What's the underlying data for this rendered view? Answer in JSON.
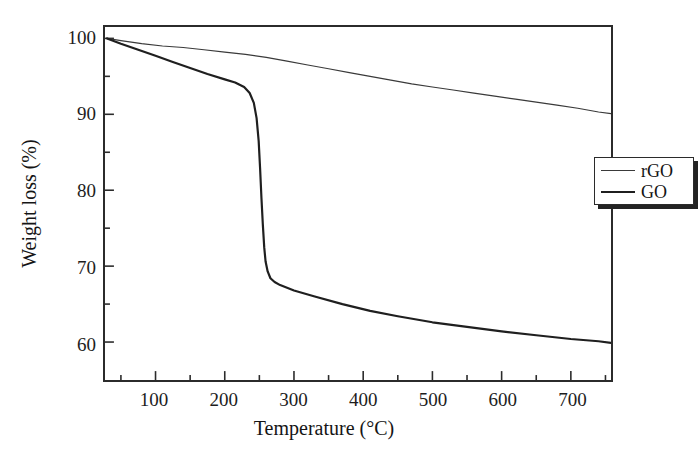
{
  "chart_data": {
    "type": "line",
    "title": "",
    "xlabel": "Temperature (°C)",
    "ylabel": "Weight loss (%)",
    "xlim": [
      27,
      758
    ],
    "ylim": [
      55,
      101.5
    ],
    "grid": false,
    "legend_position": "center-right",
    "x_major_ticks": [
      100,
      200,
      300,
      400,
      500,
      600,
      700
    ],
    "x_major_tick_labels": [
      "100",
      "200",
      "300",
      "400",
      "500",
      "600",
      "700"
    ],
    "x_minor_tick_step": 50,
    "y_major_ticks": [
      60,
      70,
      80,
      90,
      100
    ],
    "y_major_tick_labels": [
      "60",
      "70",
      "80",
      "90",
      "100"
    ],
    "y_minor_ticks": [
      65,
      75,
      85,
      95
    ],
    "series": [
      {
        "name": "rGO",
        "color": "#3a3a3a",
        "width": 1.2,
        "x": [
          30,
          50,
          80,
          110,
          140,
          170,
          200,
          230,
          260,
          290,
          320,
          350,
          380,
          410,
          440,
          470,
          500,
          530,
          560,
          590,
          620,
          650,
          680,
          710,
          740,
          758
        ],
        "y": [
          100.0,
          99.7,
          99.3,
          99.0,
          98.8,
          98.5,
          98.2,
          97.9,
          97.5,
          97.0,
          96.5,
          96.0,
          95.5,
          95.0,
          94.5,
          94.0,
          93.6,
          93.2,
          92.8,
          92.4,
          92.0,
          91.6,
          91.2,
          90.8,
          90.3,
          90.1
        ]
      },
      {
        "name": "GO",
        "color": "#1f1f1f",
        "width": 2.2,
        "x": [
          30,
          50,
          75,
          100,
          125,
          150,
          175,
          200,
          215,
          228,
          236,
          242,
          246,
          249,
          251,
          253,
          255,
          257,
          259,
          262,
          266,
          272,
          280,
          300,
          330,
          370,
          410,
          450,
          500,
          550,
          600,
          650,
          700,
          740,
          758
        ],
        "y": [
          100.0,
          99.3,
          98.5,
          97.7,
          96.9,
          96.1,
          95.3,
          94.6,
          94.2,
          93.6,
          92.8,
          91.5,
          89.5,
          86.5,
          83.0,
          79.0,
          75.5,
          72.5,
          70.6,
          69.3,
          68.4,
          67.9,
          67.5,
          66.8,
          66.0,
          65.0,
          64.1,
          63.4,
          62.6,
          62.0,
          61.4,
          60.9,
          60.4,
          60.1,
          59.9
        ]
      }
    ]
  },
  "legend": {
    "entries": [
      {
        "label": "rGO"
      },
      {
        "label": "GO"
      }
    ]
  }
}
